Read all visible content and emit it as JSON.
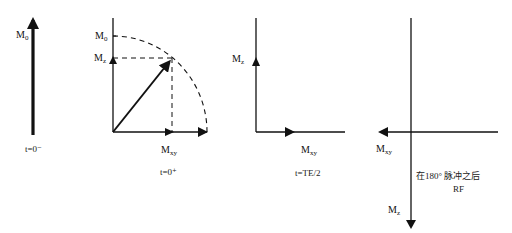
{
  "diagram": {
    "type": "magnetization-vector-diagram",
    "panels": [
      {
        "id": "t0-minus",
        "caption": "t=0⁻",
        "labels": {
          "m0": {
            "main": "M",
            "sub": "0"
          }
        }
      },
      {
        "id": "t0-plus",
        "caption": "t=0⁺",
        "labels": {
          "m0": {
            "main": "M",
            "sub": "0"
          },
          "mz": {
            "main": "M",
            "sub": "z"
          },
          "mxy": {
            "main": "M",
            "sub": "xy"
          }
        }
      },
      {
        "id": "te-half",
        "caption": "t=TE/2",
        "labels": {
          "mz": {
            "main": "M",
            "sub": "z"
          },
          "mxy": {
            "main": "M",
            "sub": "xy"
          }
        }
      },
      {
        "id": "after-180",
        "caption_line1": "在180°  脉冲之后",
        "caption_line2": "RF",
        "labels": {
          "mxy": {
            "main": "M",
            "sub": "xy"
          },
          "mz": {
            "main": "M",
            "sub": "z"
          }
        }
      }
    ],
    "colors": {
      "stroke": "#111111",
      "background": "#ffffff"
    }
  }
}
